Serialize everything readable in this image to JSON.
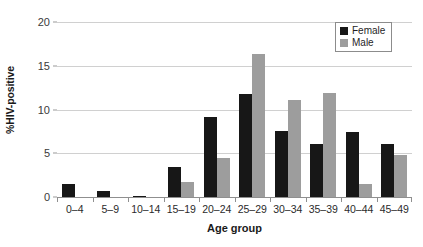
{
  "chart_data": {
    "type": "bar",
    "title": "",
    "xlabel": "Age group",
    "ylabel": "%HIV-positive",
    "categories": [
      "0–4",
      "5–9",
      "10–14",
      "15–19",
      "20–24",
      "25–29",
      "30–34",
      "35–39",
      "40–44",
      "45–49"
    ],
    "series": [
      {
        "name": "Female",
        "color": "#171717",
        "values": [
          1.5,
          0.7,
          0.15,
          3.4,
          9.1,
          11.8,
          7.5,
          6.1,
          7.4,
          6.1
        ]
      },
      {
        "name": "Male",
        "color": "#9d9d9d",
        "values": [
          0,
          0,
          0,
          1.7,
          4.5,
          16.3,
          11.1,
          11.9,
          1.5,
          4.8
        ]
      }
    ],
    "ylim": [
      0,
      20
    ],
    "y_ticks": [
      0,
      5,
      10,
      15,
      20
    ],
    "y_tick_labels": [
      "0",
      "5",
      "10",
      "15",
      "20"
    ],
    "grid": "horizontal",
    "legend_position": "top-right"
  },
  "legend": {
    "items": [
      {
        "label": "Female",
        "swatch": "female-swatch"
      },
      {
        "label": "Male",
        "swatch": "male-swatch"
      }
    ]
  }
}
